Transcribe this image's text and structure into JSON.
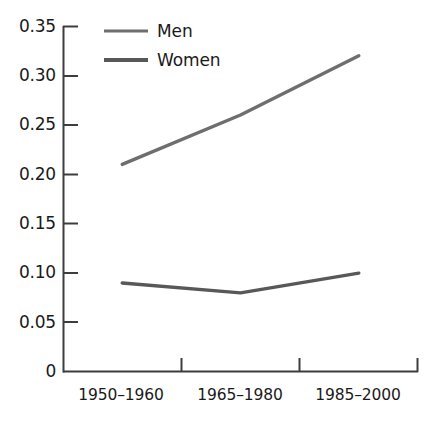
{
  "chart_data": {
    "type": "line",
    "title": "",
    "xlabel": "",
    "ylabel": "",
    "categories": [
      "1950–1960",
      "1965–1980",
      "1985–2000"
    ],
    "series": [
      {
        "name": "Men",
        "values": [
          0.21,
          0.26,
          0.32
        ],
        "color": "#6e6e6e",
        "line_width": 3
      },
      {
        "name": "Women",
        "values": [
          0.09,
          0.08,
          0.1
        ],
        "color": "#585858",
        "line_width": 3
      }
    ],
    "ylim": [
      0,
      0.35
    ],
    "yticks": [
      0,
      0.05,
      0.1,
      0.15,
      0.2,
      0.25,
      0.3,
      0.35
    ],
    "ytick_labels": [
      "0",
      "0.05",
      "0.10",
      "0.15",
      "0.20",
      "0.25",
      "0.30",
      "0.35"
    ],
    "grid": false,
    "legend_position": "top-left-inside",
    "axis_color": "#3d3d3d"
  },
  "axes": {
    "y": {
      "ticks": [
        {
          "label": "0.35",
          "value": 0.35
        },
        {
          "label": "0.30",
          "value": 0.3
        },
        {
          "label": "0.25",
          "value": 0.25
        },
        {
          "label": "0.20",
          "value": 0.2
        },
        {
          "label": "0.15",
          "value": 0.15
        },
        {
          "label": "0.10",
          "value": 0.1
        },
        {
          "label": "0.05",
          "value": 0.05
        },
        {
          "label": "0",
          "value": 0
        }
      ]
    },
    "x": {
      "ticks": [
        {
          "label": "1950–1960"
        },
        {
          "label": "1965–1980"
        },
        {
          "label": "1985–2000"
        }
      ]
    }
  },
  "legend": {
    "items": [
      {
        "label": "Men"
      },
      {
        "label": "Women"
      }
    ]
  }
}
